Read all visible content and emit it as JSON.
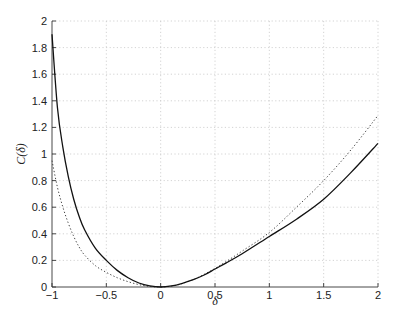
{
  "chart_data": {
    "type": "line",
    "title": "",
    "xlabel": "δ",
    "ylabel": "C(δ)",
    "xlim": [
      -1,
      2
    ],
    "ylim": [
      0,
      2
    ],
    "grid": true,
    "legend": null,
    "x_ticks": [
      -1,
      -0.5,
      0,
      0.5,
      1,
      1.5,
      2
    ],
    "x_tick_labels": [
      "−1",
      "−0.5",
      "0",
      "0.5",
      "1",
      "1.5",
      "2"
    ],
    "y_ticks": [
      0,
      0.2,
      0.4,
      0.6,
      0.8,
      1,
      1.2,
      1.4,
      1.6,
      1.8,
      2
    ],
    "y_tick_labels": [
      "0",
      "0.2",
      "0.4",
      "0.6",
      "0.8",
      "1",
      "1.2",
      "1.4",
      "1.6",
      "1.8",
      "2"
    ],
    "series": [
      {
        "name": "solid",
        "style": "solid",
        "color": "#111111",
        "x": [
          -1.0,
          -0.95,
          -0.9,
          -0.85,
          -0.8,
          -0.75,
          -0.7,
          -0.6,
          -0.5,
          -0.4,
          -0.3,
          -0.2,
          -0.1,
          0.0,
          0.1,
          0.2,
          0.3,
          0.4,
          0.5,
          0.6,
          0.75,
          1.0,
          1.25,
          1.5,
          1.75,
          2.0
        ],
        "values": [
          1.9,
          1.35,
          1.05,
          0.83,
          0.66,
          0.53,
          0.43,
          0.29,
          0.2,
          0.125,
          0.07,
          0.03,
          0.008,
          0.0,
          0.008,
          0.028,
          0.055,
          0.09,
          0.135,
          0.18,
          0.25,
          0.38,
          0.51,
          0.66,
          0.86,
          1.08
        ]
      },
      {
        "name": "dotted",
        "style": "dotted",
        "color": "#444444",
        "x": [
          -1.0,
          -0.95,
          -0.9,
          -0.85,
          -0.8,
          -0.75,
          -0.7,
          -0.6,
          -0.5,
          -0.4,
          -0.3,
          -0.2,
          -0.1,
          0.0,
          0.1,
          0.2,
          0.3,
          0.4,
          0.5,
          0.6,
          0.75,
          1.0,
          1.25,
          1.5,
          1.75,
          2.0
        ],
        "values": [
          0.95,
          0.75,
          0.6,
          0.48,
          0.38,
          0.3,
          0.24,
          0.16,
          0.11,
          0.07,
          0.04,
          0.018,
          0.004,
          0.0,
          0.006,
          0.026,
          0.055,
          0.095,
          0.14,
          0.19,
          0.27,
          0.41,
          0.6,
          0.8,
          1.03,
          1.29
        ]
      }
    ]
  }
}
